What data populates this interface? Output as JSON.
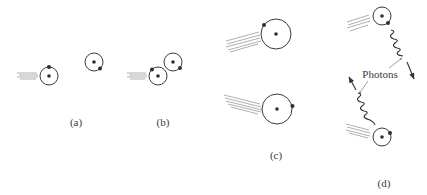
{
  "figure": {
    "panels": [
      {
        "id": "a",
        "label": "(a)"
      },
      {
        "id": "b",
        "label": "(b)"
      },
      {
        "id": "c",
        "label": "(c)"
      },
      {
        "id": "d",
        "label": "(d)"
      }
    ],
    "annotation": {
      "photons_label": "Photons"
    },
    "colors": {
      "ink": "#333333",
      "motion_streak": "#9a9a9a",
      "background": "#ffffff"
    }
  }
}
